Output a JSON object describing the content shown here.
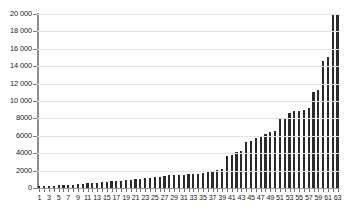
{
  "chart_data": {
    "type": "bar",
    "title": "",
    "subtitle": "",
    "xlabel": "",
    "ylabel": "",
    "xlim": [
      1,
      63
    ],
    "ylim": [
      0,
      20000
    ],
    "grid": true,
    "legend": null,
    "y_ticks": [
      0,
      2000,
      4000,
      6000,
      8000,
      10000,
      12000,
      14000,
      16000,
      18000,
      20000
    ],
    "y_tick_labels": [
      "0",
      "2000",
      "4000",
      "6000",
      "8000",
      "10 000",
      "12 000",
      "14 000",
      "16 000",
      "18 000",
      "20 000"
    ],
    "x_tick_labels": [
      "1",
      "3",
      "5",
      "7",
      "9",
      "11",
      "13",
      "15",
      "17",
      "19",
      "21",
      "23",
      "25",
      "27",
      "29",
      "31",
      "33",
      "35",
      "37",
      "39",
      "41",
      "43",
      "45",
      "47",
      "49",
      "51",
      "53",
      "55",
      "57",
      "59",
      "61",
      "63"
    ],
    "categories": [
      1,
      2,
      3,
      4,
      5,
      6,
      7,
      8,
      9,
      10,
      11,
      12,
      13,
      14,
      15,
      16,
      17,
      18,
      19,
      20,
      21,
      22,
      23,
      24,
      25,
      26,
      27,
      28,
      29,
      30,
      31,
      32,
      33,
      34,
      35,
      36,
      37,
      38,
      39,
      40,
      41,
      42,
      43,
      44,
      45,
      46,
      47,
      48,
      49,
      50,
      51,
      52,
      53,
      54,
      55,
      56,
      57,
      58,
      59,
      60,
      61,
      62,
      63
    ],
    "values": [
      180,
      200,
      230,
      260,
      300,
      330,
      360,
      400,
      430,
      470,
      520,
      560,
      600,
      650,
      700,
      750,
      800,
      860,
      900,
      950,
      1000,
      1060,
      1120,
      1180,
      1250,
      1320,
      1400,
      1480,
      1500,
      1520,
      1550,
      1580,
      1600,
      1650,
      1700,
      1800,
      1900,
      2050,
      2200,
      3700,
      3800,
      4100,
      4200,
      5300,
      5400,
      5800,
      6000,
      6200,
      6400,
      6600,
      8000,
      8100,
      8600,
      8800,
      8900,
      9000,
      9200,
      11000,
      11300,
      14600,
      15100,
      19900,
      20000
    ]
  },
  "bar_color": "#2b2b2b",
  "grid_color": "#e2e2e2",
  "axis_color": "#8d8d8d",
  "background_color": "#ffffff"
}
